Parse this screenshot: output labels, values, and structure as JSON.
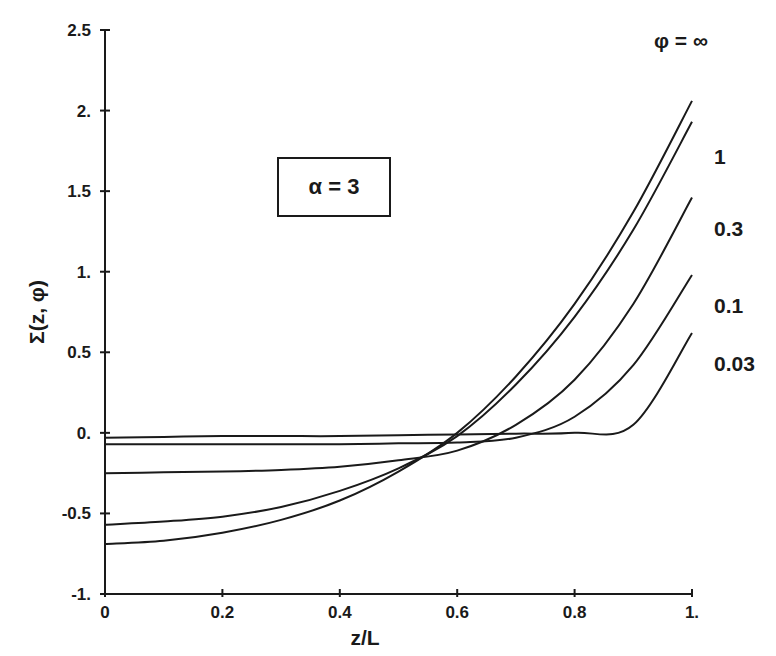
{
  "chart_data": {
    "type": "line",
    "title": "",
    "xlabel": "z/L",
    "ylabel": "Σ(z,  φ)",
    "xlim": [
      0,
      1
    ],
    "ylim": [
      -1,
      2.5
    ],
    "grid": false,
    "x_ticks": [
      "0",
      "0.2",
      "0.4",
      "0.6",
      "0.8",
      "1."
    ],
    "x_tick_values": [
      0,
      0.2,
      0.4,
      0.6,
      0.8,
      1.0
    ],
    "y_ticks": [
      "-1.",
      "-0.5",
      "0.",
      "0.5",
      "1.",
      "1.5",
      "2.",
      "2.5"
    ],
    "y_tick_values": [
      -1,
      -0.5,
      0,
      0.5,
      1,
      1.5,
      2,
      2.5
    ],
    "annotation": "α = 3",
    "legend_title": "φ = ∞",
    "legend_position": "right, labels placed at curve ends",
    "x": [
      0,
      0.1,
      0.2,
      0.3,
      0.4,
      0.5,
      0.6,
      0.7,
      0.8,
      0.9,
      1.0
    ],
    "series": [
      {
        "name": "φ = ∞",
        "label": "",
        "values": [
          -0.69,
          -0.67,
          -0.62,
          -0.54,
          -0.42,
          -0.24,
          0.0,
          0.35,
          0.8,
          1.37,
          2.06
        ]
      },
      {
        "name": "φ = 1",
        "label": "1",
        "values": [
          -0.57,
          -0.55,
          -0.52,
          -0.46,
          -0.36,
          -0.22,
          -0.02,
          0.3,
          0.72,
          1.26,
          1.93
        ]
      },
      {
        "name": "φ = 0.3",
        "label": "0.3",
        "values": [
          -0.25,
          -0.245,
          -0.24,
          -0.23,
          -0.21,
          -0.17,
          -0.11,
          0.05,
          0.33,
          0.8,
          1.46
        ]
      },
      {
        "name": "φ = 0.1",
        "label": "0.1",
        "values": [
          -0.07,
          -0.07,
          -0.07,
          -0.07,
          -0.07,
          -0.065,
          -0.06,
          -0.03,
          0.1,
          0.42,
          0.98
        ]
      },
      {
        "name": "φ = 0.03",
        "label": "0.03",
        "values": [
          -0.03,
          -0.025,
          -0.02,
          -0.02,
          -0.02,
          -0.015,
          -0.01,
          -0.005,
          0.0,
          0.05,
          0.62
        ]
      }
    ]
  },
  "labels": {
    "annotation": "α = 3",
    "legend_title": "φ = ∞",
    "xlabel": "z/L",
    "ylabel": "Σ(z,  φ)"
  }
}
